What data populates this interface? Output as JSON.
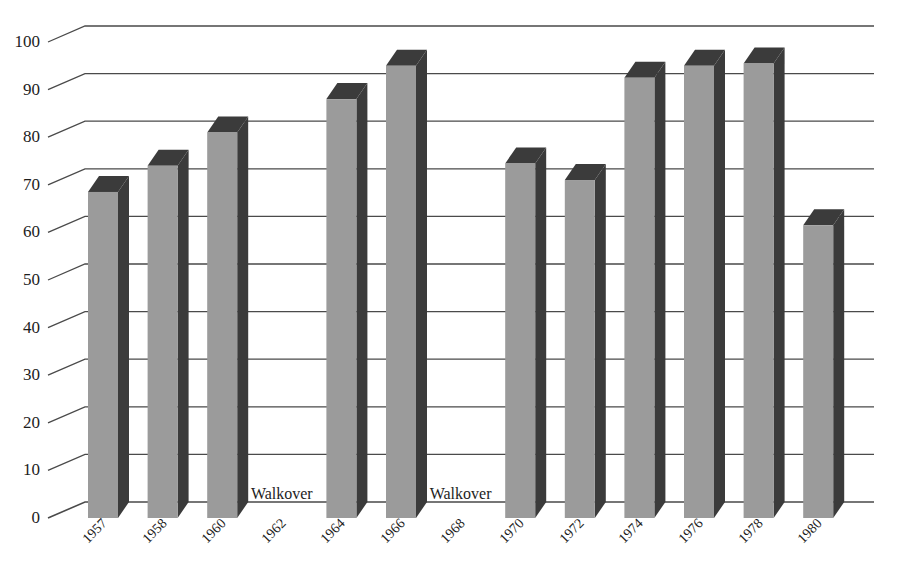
{
  "chart_data": {
    "type": "bar",
    "title": "",
    "subtitle": "",
    "xlabel": "",
    "ylabel": "",
    "ylim": [
      0,
      100
    ],
    "ytick_step": 10,
    "grid": true,
    "legend": null,
    "style": "pseudo-3d vertical bars, grey faces with dark right/top shading, stepped gridlines",
    "categories": [
      "1957",
      "1958",
      "1960",
      "1962",
      "1964",
      "1966",
      "1968",
      "1970",
      "1972",
      "1974",
      "1976",
      "1978",
      "1980"
    ],
    "values": [
      68.5,
      74,
      81,
      null,
      88,
      95,
      null,
      74.5,
      71,
      92.5,
      95,
      95.5,
      61.5
    ],
    "ytick_labels": [
      "100",
      "90",
      "80",
      "70",
      "60",
      "50",
      "40",
      "30",
      "20",
      "10",
      "0"
    ],
    "ytick_values": [
      100,
      90,
      80,
      70,
      60,
      50,
      40,
      30,
      20,
      10,
      0
    ],
    "annotations": [
      {
        "text": "Walkover",
        "category": "1962",
        "value": 0
      },
      {
        "text": "Walkover",
        "category": "1968",
        "value": 0
      }
    ],
    "colors": {
      "bar_face": "#9b9b9b",
      "bar_shadow": "#3b3b3b",
      "gridline": "#4a4a4a",
      "text": "#1d1d1d",
      "background": "#ffffff"
    }
  }
}
